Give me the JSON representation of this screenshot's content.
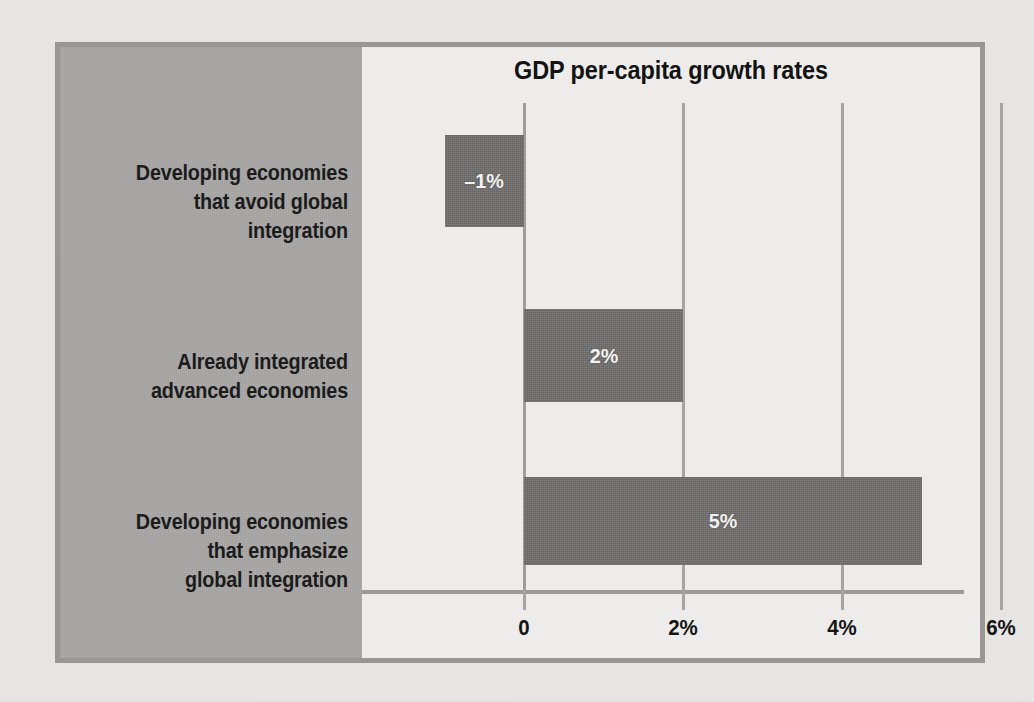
{
  "figure": {
    "title": "GDP per-capita growth rates",
    "frame_color": "#999795",
    "label_panel_color": "#a9a8a6",
    "plot_background_color": "#eeedeb",
    "bar_color": "#706f6d",
    "gridline_color": "#a5a4a2",
    "text_color": "#1b1b1b",
    "bar_label_color": "#f2f2f0"
  },
  "chart_data": {
    "type": "bar",
    "orientation": "horizontal",
    "title": "GDP per-capita growth rates",
    "xlabel": "",
    "ylabel": "",
    "categories": [
      "Developing economies\nthat avoid global\nintegration",
      "Already integrated\nadvanced economies",
      "Developing economies\nthat emphasize\nglobal integration"
    ],
    "values": [
      -1,
      2,
      5
    ],
    "value_labels": [
      "–1%",
      "2%",
      "5%"
    ],
    "xlim": [
      -1.2,
      6.0
    ],
    "xticks": [
      0,
      2,
      4,
      6
    ],
    "xtick_labels": [
      "0",
      "2%",
      "4%",
      "6%"
    ],
    "grid": true,
    "legend": "none",
    "units": "percent"
  },
  "axis": {
    "ticks": [
      {
        "value": 0,
        "label": "0"
      },
      {
        "value": 2,
        "label": "2%"
      },
      {
        "value": 4,
        "label": "4%"
      },
      {
        "value": 6,
        "label": "6%"
      }
    ]
  },
  "bars": [
    {
      "label": "–1%",
      "value": -1,
      "category": "Developing economies\nthat avoid global\nintegration"
    },
    {
      "label": "2%",
      "value": 2,
      "category": "Already integrated\nadvanced economies"
    },
    {
      "label": "5%",
      "value": 5,
      "category": "Developing economies\nthat emphasize\nglobal integration"
    }
  ]
}
